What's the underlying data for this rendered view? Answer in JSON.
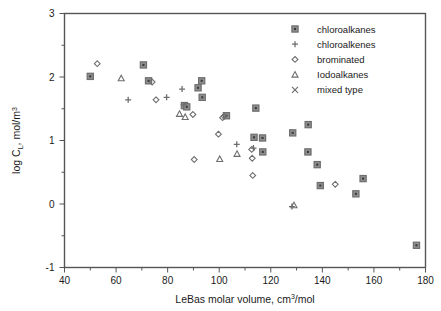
{
  "chart_data": {
    "type": "scatter",
    "title": "",
    "xlabel": "LeBas molar volume, cm3/mol",
    "xlabel_parts": {
      "main": "LeBas molar volume, cm",
      "sup": "3",
      "tail": "/mol"
    },
    "ylabel": "log CL, mol/m3",
    "ylabel_parts": {
      "pre": "log C",
      "sub": "L",
      "mid": ",  mol/m",
      "sup": "3"
    },
    "xlim": [
      40,
      180
    ],
    "ylim": [
      -1,
      3
    ],
    "xticks": [
      40,
      60,
      80,
      100,
      120,
      140,
      160,
      180
    ],
    "xticklabels": [
      "40",
      "60",
      "80",
      "100",
      "120",
      "140",
      "160",
      "180"
    ],
    "xminor_step": 10,
    "yticks": [
      -1,
      0,
      1,
      2,
      3
    ],
    "yticklabels": [
      "-1",
      "0",
      "1",
      "2",
      "3"
    ],
    "yminor_step": 0.5,
    "grid": false,
    "legend_position": "top-right",
    "marker_color": "#6e6e6e",
    "frame_color": "#555555",
    "series": [
      {
        "name": "chloroalkanes",
        "marker": "square",
        "points": [
          [
            50.0,
            2.01
          ],
          [
            70.6,
            2.19
          ],
          [
            72.6,
            1.94
          ],
          [
            86.5,
            1.55
          ],
          [
            87.4,
            1.53
          ],
          [
            91.8,
            1.83
          ],
          [
            93.2,
            1.94
          ],
          [
            93.4,
            1.68
          ],
          [
            102.8,
            1.39
          ],
          [
            114.2,
            1.51
          ],
          [
            113.5,
            1.05
          ],
          [
            116.8,
            1.04
          ],
          [
            116.9,
            0.82
          ],
          [
            128.5,
            1.12
          ],
          [
            134.5,
            1.25
          ],
          [
            134.4,
            0.82
          ],
          [
            138.0,
            0.62
          ],
          [
            139.2,
            0.29
          ],
          [
            153.0,
            0.16
          ],
          [
            155.8,
            0.4
          ],
          [
            176.5,
            -0.65
          ]
        ]
      },
      {
        "name": "chloroalkenes",
        "marker": "plus",
        "points": [
          [
            64.7,
            1.64
          ],
          [
            79.6,
            1.68
          ],
          [
            85.6,
            1.81
          ],
          [
            86.2,
            1.56
          ],
          [
            106.8,
            0.94
          ],
          [
            113.3,
            0.88
          ],
          [
            128.2,
            -0.04
          ]
        ]
      },
      {
        "name": "brominated",
        "marker": "diamond",
        "points": [
          [
            52.7,
            2.21
          ],
          [
            74.0,
            1.92
          ],
          [
            75.5,
            1.64
          ],
          [
            89.8,
            1.41
          ],
          [
            90.3,
            0.7
          ],
          [
            99.7,
            1.1
          ],
          [
            101.3,
            1.36
          ],
          [
            101.9,
            1.38
          ],
          [
            112.6,
            0.86
          ],
          [
            112.8,
            0.72
          ],
          [
            113.0,
            0.45
          ],
          [
            145.0,
            0.31
          ]
        ]
      },
      {
        "name": "Iodoalkanes",
        "marker": "triangle",
        "points": [
          [
            62.0,
            1.98
          ],
          [
            84.6,
            1.42
          ],
          [
            86.8,
            1.37
          ],
          [
            100.2,
            0.71
          ],
          [
            106.9,
            0.79
          ],
          [
            129.0,
            -0.02
          ]
        ]
      },
      {
        "name": "mixed type",
        "marker": "cross",
        "points": []
      }
    ],
    "legend_entries": [
      {
        "label": "chloroalkanes",
        "marker": "square"
      },
      {
        "label": "chloroalkenes",
        "marker": "plus"
      },
      {
        "label": "brominated",
        "marker": "diamond"
      },
      {
        "label": "Iodoalkanes",
        "marker": "triangle"
      },
      {
        "label": "mixed type",
        "marker": "cross"
      }
    ]
  }
}
